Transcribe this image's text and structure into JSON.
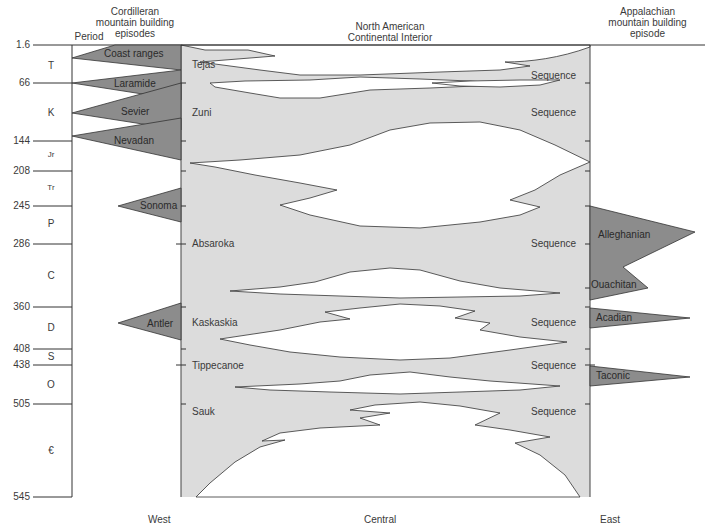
{
  "headers": {
    "period": "Period",
    "cordilleran": [
      "Cordilleran",
      "mountain building",
      "episodes"
    ],
    "interior": [
      "North American",
      "Continental Interior"
    ],
    "appalachian": [
      "Appalachian",
      "mountain building",
      "episode"
    ]
  },
  "ages": [
    {
      "label": "1.6",
      "y": 45
    },
    {
      "label": "66",
      "y": 83
    },
    {
      "label": "144",
      "y": 141
    },
    {
      "label": "208",
      "y": 171
    },
    {
      "label": "245",
      "y": 206
    },
    {
      "label": "286",
      "y": 244
    },
    {
      "label": "360",
      "y": 307
    },
    {
      "label": "408",
      "y": 349
    },
    {
      "label": "438",
      "y": 365
    },
    {
      "label": "505",
      "y": 404
    },
    {
      "label": "545",
      "y": 497
    }
  ],
  "periods": [
    {
      "label": "T",
      "y": 66
    },
    {
      "label": "K",
      "y": 113
    },
    {
      "label": "Jr",
      "y": 156
    },
    {
      "label": "Tr",
      "y": 189
    },
    {
      "label": "P",
      "y": 224
    },
    {
      "label": "C",
      "y": 276
    },
    {
      "label": "D",
      "y": 328
    },
    {
      "label": "S",
      "y": 357
    },
    {
      "label": "O",
      "y": 385
    },
    {
      "label": "€",
      "y": 451
    }
  ],
  "cordilleran_episodes": [
    {
      "label": "Coast ranges"
    },
    {
      "label": "Laramide"
    },
    {
      "label": "Sevier"
    },
    {
      "label": "Nevadan"
    },
    {
      "label": "Sonoma"
    },
    {
      "label": "Antler"
    }
  ],
  "sequences": [
    {
      "name": "Tejas",
      "suffix": "Sequence"
    },
    {
      "name": "Zuni",
      "suffix": "Sequence"
    },
    {
      "name": "Absaroka",
      "suffix": "Sequence"
    },
    {
      "name": "Kaskaskia",
      "suffix": "Sequence"
    },
    {
      "name": "Tippecanoe",
      "suffix": "Sequence"
    },
    {
      "name": "Sauk",
      "suffix": "Sequence"
    }
  ],
  "appalachian_episodes": [
    {
      "label": "Alleghanian"
    },
    {
      "label": "Ouachitan"
    },
    {
      "label": "Acadian"
    },
    {
      "label": "Taconic"
    }
  ],
  "directions": {
    "west": "West",
    "central": "Central",
    "east": "East"
  },
  "colors": {
    "sequence_fill": "#dcdcdc",
    "orogeny_fill": "#8c8c8c",
    "line": "#333333"
  }
}
